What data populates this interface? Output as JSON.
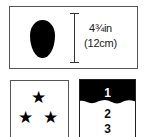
{
  "size_panel": {
    "shape": "oval-silhouette",
    "dimension_icon": "vertical-dimension-line",
    "size_imperial": "4¾in",
    "size_metric": "(12cm)"
  },
  "stars_panel": {
    "icon": "star-icon",
    "count": 3,
    "stars": [
      "★",
      "★",
      "★"
    ]
  },
  "numbers_panel": {
    "items": [
      "1",
      "2",
      "3"
    ],
    "highlighted": "1",
    "highlight_color": "#000000"
  }
}
